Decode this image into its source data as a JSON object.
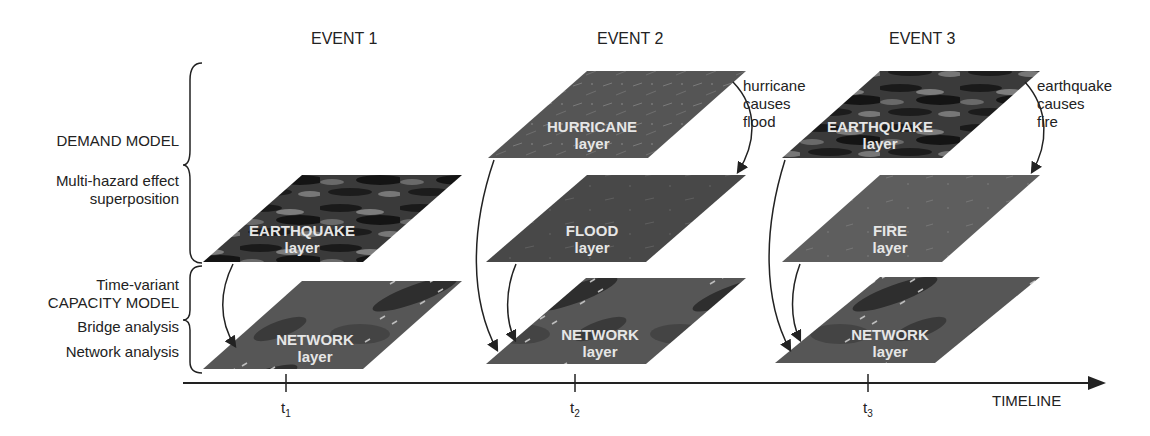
{
  "left_labels": {
    "demand_model": "DEMAND MODEL",
    "multi_hazard_1": "Multi-hazard effect",
    "multi_hazard_2": "superposition",
    "time_variant": "Time-variant",
    "capacity_model": "CAPACITY MODEL",
    "bridge_analysis": "Bridge analysis",
    "network_analysis": "Network analysis"
  },
  "events": [
    {
      "title": "EVENT 1",
      "tick": "t",
      "tick_sub": "1",
      "layers": [
        {
          "name": "EARTHQUAKE",
          "sub": "layer",
          "texture": "earthquake"
        },
        {
          "name": "NETWORK",
          "sub": "layer",
          "texture": "network"
        }
      ]
    },
    {
      "title": "EVENT 2",
      "tick": "t",
      "tick_sub": "2",
      "cause": [
        "hurricane",
        "causes",
        "flood"
      ],
      "layers": [
        {
          "name": "HURRICANE",
          "sub": "layer",
          "texture": "hurricane"
        },
        {
          "name": "FLOOD",
          "sub": "layer",
          "texture": "flood"
        },
        {
          "name": "NETWORK",
          "sub": "layer",
          "texture": "network"
        }
      ]
    },
    {
      "title": "EVENT 3",
      "tick": "t",
      "tick_sub": "3",
      "cause": [
        "earthquake",
        "causes",
        "fire"
      ],
      "layers": [
        {
          "name": "EARTHQUAKE",
          "sub": "layer",
          "texture": "earthquake"
        },
        {
          "name": "FIRE",
          "sub": "layer",
          "texture": "fire"
        },
        {
          "name": "NETWORK",
          "sub": "layer",
          "texture": "network"
        }
      ]
    }
  ],
  "timeline": {
    "label": "TIMELINE"
  },
  "colors": {
    "earthquake_dark": "#1f1f1f",
    "earthquake_light": "#8a8a8a",
    "hurricane": "#565656",
    "flood": "#4a4a4a",
    "fire": "#5f5f5f",
    "network": "#555555",
    "line": "#222222"
  }
}
